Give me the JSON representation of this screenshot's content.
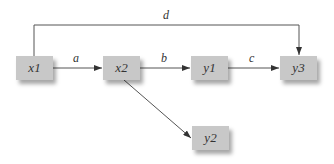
{
  "diagram": {
    "nodes": [
      {
        "id": "x1",
        "label": "x1"
      },
      {
        "id": "x2",
        "label": "x2"
      },
      {
        "id": "y1",
        "label": "y1"
      },
      {
        "id": "y2",
        "label": "y2"
      },
      {
        "id": "y3",
        "label": "y3"
      }
    ],
    "edges": [
      {
        "from": "x1",
        "to": "x2",
        "label": "a"
      },
      {
        "from": "x2",
        "to": "y1",
        "label": "b"
      },
      {
        "from": "y1",
        "to": "y3",
        "label": "c"
      },
      {
        "from": "x1",
        "to": "y3",
        "label": "d"
      },
      {
        "from": "x2",
        "to": "y2",
        "label": ""
      }
    ],
    "colors": {
      "node_fill": "#c8c8c8",
      "edge": "#555555",
      "text": "#333333"
    }
  }
}
